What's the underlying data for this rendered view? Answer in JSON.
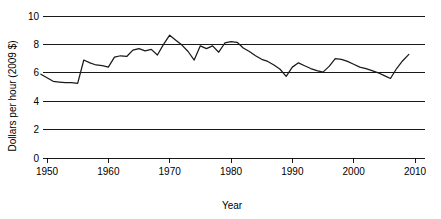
{
  "chart_data": {
    "type": "line",
    "title": "",
    "subtitle": "",
    "xlabel": "Year",
    "ylabel": "Dollars per hour (2009 $)",
    "xlim": [
      1948,
      2011
    ],
    "ylim": [
      0,
      10
    ],
    "xticks": [
      1950,
      1960,
      1970,
      1980,
      1990,
      2000,
      2010
    ],
    "xtick_labels": [
      "1950",
      "1960",
      "1970",
      "1980",
      "1990",
      "2000",
      "2010"
    ],
    "yticks": [
      0,
      2,
      4,
      6,
      8,
      10
    ],
    "ytick_labels": [
      "0",
      "2",
      "4",
      "6",
      "8",
      "10"
    ],
    "grid": "horizontal",
    "legend": "none",
    "line_color": "#1a1a1a",
    "x": [
      1949,
      1950,
      1951,
      1952,
      1953,
      1954,
      1955,
      1956,
      1957,
      1958,
      1959,
      1960,
      1961,
      1962,
      1963,
      1964,
      1965,
      1966,
      1967,
      1968,
      1969,
      1970,
      1971,
      1972,
      1973,
      1974,
      1975,
      1976,
      1977,
      1978,
      1979,
      1980,
      1981,
      1982,
      1983,
      1984,
      1985,
      1986,
      1987,
      1988,
      1989,
      1990,
      1991,
      1992,
      1993,
      1994,
      1995,
      1996,
      1997,
      1998,
      1999,
      2000,
      2001,
      2002,
      2003,
      2004,
      2005,
      2006,
      2007,
      2008,
      2009
    ],
    "y": [
      5.9,
      5.65,
      5.4,
      5.35,
      5.3,
      5.3,
      5.25,
      6.9,
      6.7,
      6.55,
      6.5,
      6.4,
      7.1,
      7.2,
      7.15,
      7.6,
      7.7,
      7.55,
      7.65,
      7.25,
      8.0,
      8.65,
      8.3,
      7.95,
      7.5,
      6.9,
      7.9,
      7.7,
      7.9,
      7.45,
      8.1,
      8.2,
      8.15,
      7.75,
      7.5,
      7.2,
      6.95,
      6.8,
      6.55,
      6.25,
      5.75,
      6.4,
      6.7,
      6.5,
      6.3,
      6.15,
      6.05,
      6.45,
      7.0,
      6.95,
      6.8,
      6.6,
      6.4,
      6.3,
      6.15,
      6.0,
      5.8,
      5.6,
      6.3,
      6.85,
      7.3
    ],
    "series": [
      {
        "name": "Real minimum wage",
        "values": [
          5.9,
          5.65,
          5.4,
          5.35,
          5.3,
          5.3,
          5.25,
          6.9,
          6.7,
          6.55,
          6.5,
          6.4,
          7.1,
          7.2,
          7.15,
          7.6,
          7.7,
          7.55,
          7.65,
          7.25,
          8.0,
          8.65,
          8.3,
          7.95,
          7.5,
          6.9,
          7.9,
          7.7,
          7.9,
          7.45,
          8.1,
          8.2,
          8.15,
          7.75,
          7.5,
          7.2,
          6.95,
          6.8,
          6.55,
          6.25,
          5.75,
          6.4,
          6.7,
          6.5,
          6.3,
          6.15,
          6.05,
          6.45,
          7.0,
          6.95,
          6.8,
          6.6,
          6.4,
          6.3,
          6.15,
          6.0,
          5.8,
          5.6,
          6.3,
          6.85,
          7.3
        ]
      }
    ]
  }
}
